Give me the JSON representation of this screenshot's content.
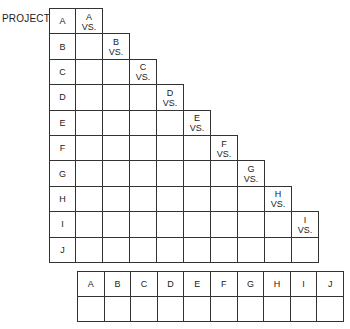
{
  "title_label": "PROJECT",
  "projects": [
    "A",
    "B",
    "C",
    "D",
    "E",
    "F",
    "G",
    "H",
    "I",
    "J"
  ],
  "vs_text": "VS.",
  "bottom_table": {
    "headers": [
      "A",
      "B",
      "C",
      "D",
      "E",
      "F",
      "G",
      "H",
      "I",
      "J"
    ],
    "values": [
      "",
      "",
      "",
      "",
      "",
      "",
      "",
      "",
      "",
      ""
    ]
  }
}
